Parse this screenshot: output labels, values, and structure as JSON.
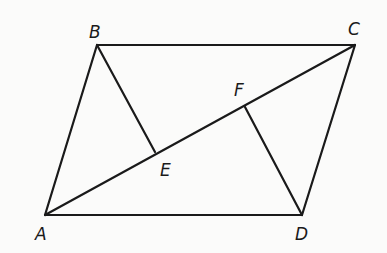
{
  "diagram": {
    "type": "geometry",
    "stroke_color": "#1a1a1a",
    "background": "#fbfbfa",
    "points": {
      "A": {
        "label": "A",
        "x": 45,
        "y": 215
      },
      "B": {
        "label": "B",
        "x": 97,
        "y": 45
      },
      "C": {
        "label": "C",
        "x": 355,
        "y": 45
      },
      "D": {
        "label": "D",
        "x": 302,
        "y": 215
      },
      "E": {
        "label": "E",
        "x": 155,
        "y": 152
      },
      "F": {
        "label": "F",
        "x": 245,
        "y": 107
      }
    },
    "segments": [
      "AB",
      "BC",
      "CD",
      "DA",
      "AC",
      "BE",
      "DF"
    ]
  }
}
